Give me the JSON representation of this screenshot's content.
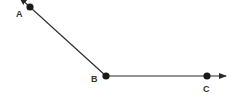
{
  "diagram": {
    "type": "angle",
    "colors": {
      "stroke": "#2a2a2a",
      "point": "#1a1a1a",
      "label": "#333333",
      "background": "#ffffff"
    },
    "points": [
      {
        "id": "A",
        "label": "A",
        "x": 30,
        "y": 7,
        "label_x": 16,
        "label_y": 17
      },
      {
        "id": "B",
        "label": "B",
        "x": 106,
        "y": 76,
        "label_x": 91,
        "label_y": 82
      },
      {
        "id": "C",
        "label": "C",
        "x": 207,
        "y": 76,
        "label_x": 203,
        "label_y": 92
      }
    ],
    "rays": [
      {
        "from": "B",
        "through": "A",
        "end_x": 20,
        "end_y": -2
      },
      {
        "from": "B",
        "through": "C",
        "end_x": 226,
        "end_y": 76
      }
    ]
  }
}
